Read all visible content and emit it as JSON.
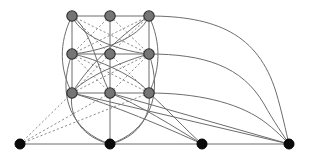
{
  "figure": {
    "width": 311,
    "height": 162,
    "background": "#ffffff"
  },
  "style": {
    "grid_node_fill": "#757575",
    "grid_node_stroke": "#2e2e2e",
    "terminal_node_fill": "#0b0b0b",
    "solid_edge_color": "#6d6d6d",
    "dashed_edge_color": "#8d8d8d",
    "grid_node_radius": 5.2,
    "terminal_node_radius": 5.0,
    "edge_width": 1,
    "dash_pattern": "2.2 2.2"
  },
  "nodes": {
    "grid": [
      {
        "id": "g00",
        "label": "grid-node-top-left",
        "x": 72,
        "y": 16,
        "row": 0,
        "col": 0
      },
      {
        "id": "g01",
        "label": "grid-node-top-center",
        "x": 110,
        "y": 16,
        "row": 0,
        "col": 1
      },
      {
        "id": "g02",
        "label": "grid-node-top-right",
        "x": 149,
        "y": 16,
        "row": 0,
        "col": 2
      },
      {
        "id": "g10",
        "label": "grid-node-middle-left",
        "x": 72,
        "y": 54,
        "row": 1,
        "col": 0
      },
      {
        "id": "g11",
        "label": "grid-node-middle-center",
        "x": 110,
        "y": 54,
        "row": 1,
        "col": 1
      },
      {
        "id": "g12",
        "label": "grid-node-middle-right",
        "x": 149,
        "y": 54,
        "row": 1,
        "col": 2
      },
      {
        "id": "g20",
        "label": "grid-node-bottom-left",
        "x": 72,
        "y": 93,
        "row": 2,
        "col": 0
      },
      {
        "id": "g21",
        "label": "grid-node-bottom-center",
        "x": 110,
        "y": 93,
        "row": 2,
        "col": 1
      },
      {
        "id": "g22",
        "label": "grid-node-bottom-right",
        "x": 149,
        "y": 93,
        "row": 2,
        "col": 2
      }
    ],
    "terminals": [
      {
        "id": "t0",
        "label": "terminal-node-1",
        "x": 20,
        "y": 144
      },
      {
        "id": "t1",
        "label": "terminal-node-2",
        "x": 110,
        "y": 144
      },
      {
        "id": "t2",
        "label": "terminal-node-3",
        "x": 202,
        "y": 144
      },
      {
        "id": "t3",
        "label": "terminal-node-4",
        "x": 289,
        "y": 144
      }
    ]
  },
  "edges": {
    "grid_horizontal": [
      {
        "from": "g00",
        "to": "g01"
      },
      {
        "from": "g01",
        "to": "g02"
      },
      {
        "from": "g10",
        "to": "g11"
      },
      {
        "from": "g11",
        "to": "g12"
      },
      {
        "from": "g20",
        "to": "g21"
      },
      {
        "from": "g21",
        "to": "g22"
      }
    ],
    "grid_vertical": [
      {
        "from": "g00",
        "to": "g10"
      },
      {
        "from": "g10",
        "to": "g20"
      },
      {
        "from": "g01",
        "to": "g11"
      },
      {
        "from": "g11",
        "to": "g21"
      },
      {
        "from": "g02",
        "to": "g12"
      },
      {
        "from": "g12",
        "to": "g22"
      }
    ],
    "baseline": [
      {
        "from": "t0",
        "to": "t1"
      },
      {
        "from": "t1",
        "to": "t2"
      },
      {
        "from": "t2",
        "to": "t3"
      }
    ],
    "dashed_from_terminal1": [
      {
        "from": "t0",
        "to": "g20"
      },
      {
        "from": "t0",
        "to": "g21"
      },
      {
        "from": "t0",
        "to": "g22"
      }
    ],
    "dashed_grid_diagonals": [
      {
        "from": "g00",
        "to": "g11"
      },
      {
        "from": "g00",
        "to": "g12"
      },
      {
        "from": "g01",
        "to": "g10"
      },
      {
        "from": "g01",
        "to": "g12"
      },
      {
        "from": "g02",
        "to": "g10"
      },
      {
        "from": "g02",
        "to": "g11"
      },
      {
        "from": "g10",
        "to": "g21"
      },
      {
        "from": "g10",
        "to": "g22"
      },
      {
        "from": "g11",
        "to": "g20"
      },
      {
        "from": "g11",
        "to": "g22"
      },
      {
        "from": "g12",
        "to": "g20"
      },
      {
        "from": "g12",
        "to": "g21"
      }
    ],
    "solid_curved_grid": [
      {
        "from": "g00",
        "to": "g21",
        "note": "long sweep down-right"
      },
      {
        "from": "g02",
        "to": "g20",
        "note": "long sweep down-left"
      },
      {
        "from": "g10",
        "to": "g02",
        "note": "bow right"
      },
      {
        "from": "g12",
        "to": "g00",
        "note": "bow left"
      },
      {
        "from": "g10",
        "to": "g22",
        "note": "bow right lower"
      },
      {
        "from": "g12",
        "to": "g20",
        "note": "bow left lower"
      }
    ],
    "curves_to_terminal2": [
      {
        "from": "g20",
        "to": "t1"
      },
      {
        "from": "g22",
        "to": "t1"
      },
      {
        "from": "g10",
        "to": "t1"
      },
      {
        "from": "g12",
        "to": "t1"
      }
    ],
    "curves_to_terminal3": [
      {
        "from": "g20",
        "to": "t2"
      },
      {
        "from": "g21",
        "to": "t2"
      },
      {
        "from": "g22",
        "to": "t2"
      }
    ],
    "curves_to_terminal4": [
      {
        "from": "g02",
        "to": "t3",
        "note": "top sweep, long flat then steep drop"
      },
      {
        "from": "g12",
        "to": "t3",
        "note": "middle sweep"
      },
      {
        "from": "g22",
        "to": "t3",
        "note": "bottom sweep"
      },
      {
        "from": "g20",
        "to": "t3",
        "note": "straight long chord"
      },
      {
        "from": "g21",
        "to": "t3",
        "note": "straight long chord"
      }
    ]
  }
}
